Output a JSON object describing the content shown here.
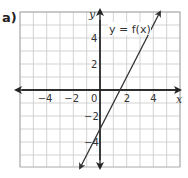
{
  "problem": {
    "part_label": "a)"
  },
  "chart_data": {
    "type": "line",
    "title": "",
    "xlabel": "x",
    "ylabel": "y",
    "xlim": [
      -6,
      6
    ],
    "ylim": [
      -6,
      6
    ],
    "grid": true,
    "x_ticks": [
      -4,
      -2,
      0,
      2,
      4
    ],
    "y_ticks": [
      4,
      2,
      -2,
      -4
    ],
    "x_tick_labels": [
      "−4",
      "−2",
      "0",
      "2",
      "4"
    ],
    "y_tick_labels": [
      "4",
      "2",
      "−2",
      "−4"
    ],
    "series": [
      {
        "name": "y = f(x)",
        "equation": "y = 2x - 3",
        "x": [
          -1.5,
          0,
          1.5,
          4.5
        ],
        "y": [
          -6,
          -3,
          0,
          6
        ]
      }
    ],
    "annotations": [
      "y = f(x)"
    ],
    "colors": {
      "grid": "#c8c8c8",
      "axis": "#222222",
      "line": "#333333",
      "frame": "#aaaaaa"
    }
  }
}
